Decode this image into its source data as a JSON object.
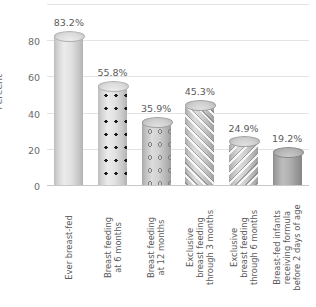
{
  "chart_data": {
    "type": "bar",
    "title": "",
    "xlabel": "",
    "ylabel": "Percent",
    "ylim": [
      0,
      100
    ],
    "grid": true,
    "legend": "none",
    "yticks": [
      0,
      20,
      40,
      60,
      80
    ],
    "ytick_labels": [
      "0",
      "20",
      "40",
      "60",
      "80"
    ],
    "gridlines": [
      0,
      20,
      40,
      60,
      80,
      100
    ],
    "categories": [
      "Ever breast-fed",
      "Breast feeding\nat 6 months",
      "Breast feeding\nat 12 months",
      "Exclusive\nbreast feeding\nthrough 3 months",
      "Exclusive\nbreast feeding\nthrough 6 months",
      "Breast-fed infants\nreceiving formula\nbefore 2 days of age"
    ],
    "values": [
      83.2,
      55.8,
      35.9,
      45.3,
      24.9,
      19.2
    ],
    "value_labels": [
      "83.2%",
      "55.8%",
      "35.9%",
      "45.3%",
      "24.9%",
      "19.2%"
    ],
    "bar_styles": [
      "solid-light",
      "dots",
      "open-circles",
      "diagonal-forward",
      "diagonal-backward",
      "solid-dark"
    ]
  },
  "colors": {
    "background": "#ffffff",
    "gridline": "#e3e3e3",
    "axis": "#c8c8c8",
    "text": "#5a5a5a",
    "tick_text": "#6b6b6b",
    "bar_light": "#e2e2e2",
    "bar_mid": "#d0d0d0",
    "bar_dark": "#b0b0b0",
    "dot": "#1c1c1c"
  }
}
